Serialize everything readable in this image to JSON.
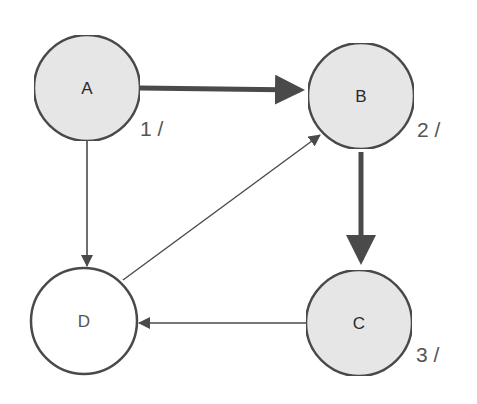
{
  "diagram": {
    "type": "directed-graph-dfs",
    "colors": {
      "visited_fill": "#e9e9e9",
      "unvisited_fill": "#ffffff",
      "stroke": "#4a4a4a",
      "edge": "#4a4a4a",
      "order_text": "#555555"
    },
    "nodes": [
      {
        "id": "A",
        "label": "A",
        "order": "1 /",
        "visited": true,
        "cx": 87,
        "cy": 88,
        "r": 53
      },
      {
        "id": "B",
        "label": "B",
        "order": "2 /",
        "visited": true,
        "cx": 361,
        "cy": 96,
        "r": 53
      },
      {
        "id": "C",
        "label": "C",
        "order": "3 /",
        "visited": true,
        "cx": 359,
        "cy": 323,
        "r": 53
      },
      {
        "id": "D",
        "label": "D",
        "order": "",
        "visited": false,
        "cx": 84,
        "cy": 321,
        "r": 53
      }
    ],
    "edges": [
      {
        "from": "A",
        "to": "B",
        "style": "tree-edge-thick"
      },
      {
        "from": "B",
        "to": "C",
        "style": "tree-edge-thick"
      },
      {
        "from": "A",
        "to": "D",
        "style": "thin"
      },
      {
        "from": "D",
        "to": "B",
        "style": "thin"
      },
      {
        "from": "C",
        "to": "D",
        "style": "thin"
      }
    ]
  }
}
